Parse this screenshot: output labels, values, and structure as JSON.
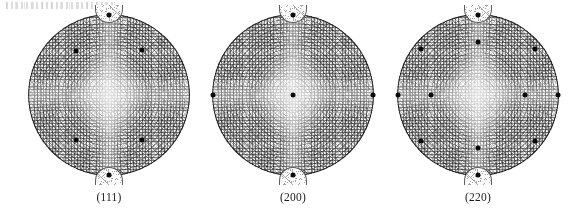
{
  "figure": {
    "type": "pole-figure-set",
    "background_color": "#ffffff",
    "dot_color": "#0a0a0a",
    "panels": [
      {
        "id": "pf-111",
        "caption": "(111)",
        "center_x": 109,
        "center_y": 95,
        "radius": 81,
        "poles": [
          {
            "label": "pole-top",
            "x_pct": 50.0,
            "y_pct": 0.5
          },
          {
            "label": "pole-bottom",
            "x_pct": 50.0,
            "y_pct": 99.5
          },
          {
            "label": "pole-upper-left",
            "x_pct": 29.5,
            "y_pct": 23.0
          },
          {
            "label": "pole-upper-right",
            "x_pct": 70.5,
            "y_pct": 22.5
          },
          {
            "label": "pole-lower-left",
            "x_pct": 29.5,
            "y_pct": 77.5
          },
          {
            "label": "pole-lower-right",
            "x_pct": 70.5,
            "y_pct": 77.5
          }
        ]
      },
      {
        "id": "pf-200",
        "caption": "(200)",
        "center_x": 293,
        "center_y": 95,
        "radius": 81,
        "poles": [
          {
            "label": "pole-center",
            "x_pct": 50.0,
            "y_pct": 50.0
          },
          {
            "label": "pole-top",
            "x_pct": 50.0,
            "y_pct": 0.5
          },
          {
            "label": "pole-bottom",
            "x_pct": 50.0,
            "y_pct": 99.5
          },
          {
            "label": "pole-left",
            "x_pct": 0.5,
            "y_pct": 50.0
          },
          {
            "label": "pole-right",
            "x_pct": 99.5,
            "y_pct": 50.0
          }
        ]
      },
      {
        "id": "pf-220",
        "caption": "(220)",
        "center_x": 478,
        "center_y": 95,
        "radius": 81,
        "poles": [
          {
            "label": "pole-north",
            "x_pct": 50.0,
            "y_pct": 0.5
          },
          {
            "label": "pole-south",
            "x_pct": 50.0,
            "y_pct": 99.5
          },
          {
            "label": "pole-west",
            "x_pct": 0.5,
            "y_pct": 50.0
          },
          {
            "label": "pole-east",
            "x_pct": 99.5,
            "y_pct": 50.0
          },
          {
            "label": "pole-inner-north",
            "x_pct": 50.0,
            "y_pct": 17.0
          },
          {
            "label": "pole-inner-south",
            "x_pct": 50.0,
            "y_pct": 83.0
          },
          {
            "label": "pole-inner-west",
            "x_pct": 21.0,
            "y_pct": 50.0
          },
          {
            "label": "pole-inner-east",
            "x_pct": 79.0,
            "y_pct": 50.0
          },
          {
            "label": "pole-nw",
            "x_pct": 15.0,
            "y_pct": 21.5
          },
          {
            "label": "pole-ne",
            "x_pct": 85.0,
            "y_pct": 21.5
          },
          {
            "label": "pole-sw",
            "x_pct": 15.0,
            "y_pct": 78.5
          },
          {
            "label": "pole-se",
            "x_pct": 85.0,
            "y_pct": 78.5
          }
        ]
      }
    ]
  },
  "chart_data": {
    "type": "scatter",
    "title": "",
    "subtitle": "",
    "xlabel": "",
    "ylabel": "",
    "projection": "stereographic (equal-angle) pole figure",
    "grid": true,
    "legend_position": "none",
    "annotations": [
      "(111)",
      "(200)",
      "(220)"
    ],
    "series": [
      {
        "name": "(111)",
        "note": "six {111} pole maxima: two on the vertical axis at the rim, four forming a square at mid-radius",
        "points_polar_deg": [
          {
            "azimuth": 90,
            "polar_radius_pct": 100
          },
          {
            "azimuth": 270,
            "polar_radius_pct": 100
          },
          {
            "azimuth": 133,
            "polar_radius_pct": 48
          },
          {
            "azimuth": 47,
            "polar_radius_pct": 48
          },
          {
            "azimuth": 227,
            "polar_radius_pct": 48
          },
          {
            "azimuth": 313,
            "polar_radius_pct": 48
          }
        ]
      },
      {
        "name": "(200)",
        "note": "five {200} pole maxima: one at the centre plus four on the rim at N, S, E, W",
        "points_polar_deg": [
          {
            "azimuth": 0,
            "polar_radius_pct": 0
          },
          {
            "azimuth": 90,
            "polar_radius_pct": 100
          },
          {
            "azimuth": 270,
            "polar_radius_pct": 100
          },
          {
            "azimuth": 180,
            "polar_radius_pct": 100
          },
          {
            "azimuth": 0,
            "polar_radius_pct": 100
          }
        ]
      },
      {
        "name": "(220)",
        "note": "twelve {220} pole maxima: four on the rim at N/S/E/W, four at mid-radius on the axes, four near the rim on the diagonals",
        "points_polar_deg": [
          {
            "azimuth": 90,
            "polar_radius_pct": 100
          },
          {
            "azimuth": 270,
            "polar_radius_pct": 100
          },
          {
            "azimuth": 180,
            "polar_radius_pct": 100
          },
          {
            "azimuth": 0,
            "polar_radius_pct": 100
          },
          {
            "azimuth": 90,
            "polar_radius_pct": 66
          },
          {
            "azimuth": 270,
            "polar_radius_pct": 66
          },
          {
            "azimuth": 180,
            "polar_radius_pct": 58
          },
          {
            "azimuth": 0,
            "polar_radius_pct": 58
          },
          {
            "azimuth": 135,
            "polar_radius_pct": 83
          },
          {
            "azimuth": 45,
            "polar_radius_pct": 83
          },
          {
            "azimuth": 225,
            "polar_radius_pct": 83
          },
          {
            "azimuth": 315,
            "polar_radius_pct": 83
          }
        ]
      }
    ]
  }
}
